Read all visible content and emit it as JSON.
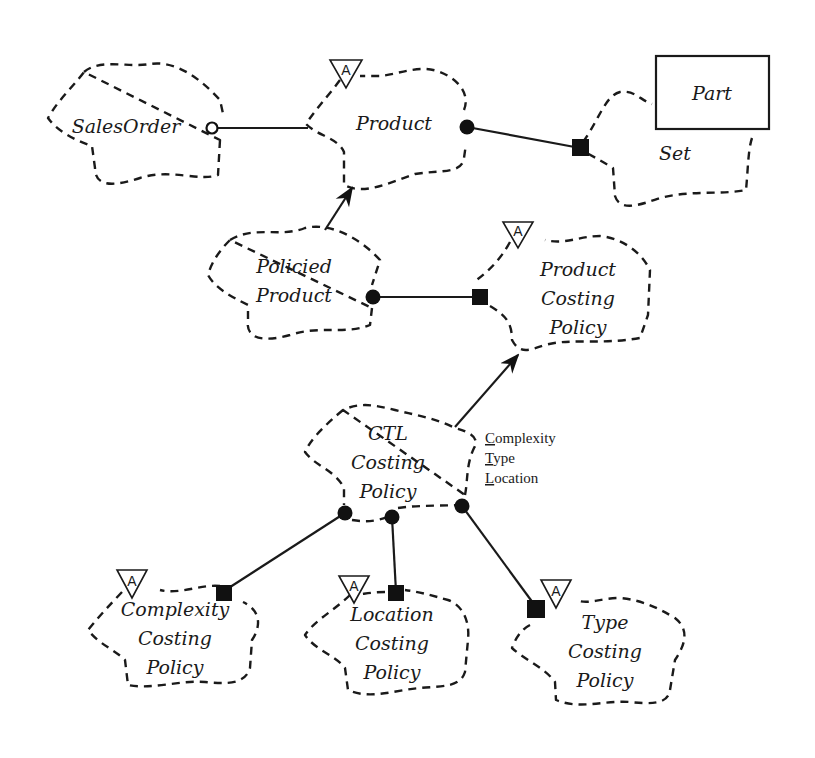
{
  "diagram": {
    "notation": "Booch class diagram",
    "classes": {
      "sales_order": {
        "label": "SalesOrder"
      },
      "product": {
        "label": "Product",
        "adornment": "A"
      },
      "part": {
        "label": "Part"
      },
      "set": {
        "label": "Set"
      },
      "policied_product": {
        "line1": "Policied",
        "line2": "Product"
      },
      "product_costing_policy": {
        "line1": "Product",
        "line2": "Costing",
        "line3": "Policy",
        "adornment": "A"
      },
      "ctl_costing_policy": {
        "line1": "CTL",
        "line2": "Costing",
        "line3": "Policy",
        "parameters": [
          {
            "initial": "C",
            "rest": "omplexity"
          },
          {
            "initial": "T",
            "rest": "ype"
          },
          {
            "initial": "L",
            "rest": "ocation"
          }
        ]
      },
      "complexity_costing_policy": {
        "line1": "Complexity",
        "line2": "Costing",
        "line3": "Policy",
        "adornment": "A"
      },
      "location_costing_policy": {
        "line1": "Location",
        "line2": "Costing",
        "line3": "Policy",
        "adornment": "A"
      },
      "type_costing_policy": {
        "line1": "Type",
        "line2": "Costing",
        "line3": "Policy",
        "adornment": "A"
      }
    },
    "relationships": [
      {
        "from": "SalesOrder",
        "to": "Product",
        "kind": "association (hollow circle / uses)"
      },
      {
        "from": "Product",
        "to": "Set",
        "kind": "has (filled circle to filled square)"
      },
      {
        "from": "Policied Product",
        "to": "Product",
        "kind": "inheritance (arrow)"
      },
      {
        "from": "Policied Product",
        "to": "Product Costing Policy",
        "kind": "has"
      },
      {
        "from": "CTL Costing Policy",
        "to": "Product Costing Policy",
        "kind": "inheritance (arrow)"
      },
      {
        "from": "CTL Costing Policy",
        "to": "Complexity Costing Policy",
        "kind": "has"
      },
      {
        "from": "CTL Costing Policy",
        "to": "Location Costing Policy",
        "kind": "has"
      },
      {
        "from": "CTL Costing Policy",
        "to": "Type Costing Policy",
        "kind": "has"
      }
    ]
  }
}
